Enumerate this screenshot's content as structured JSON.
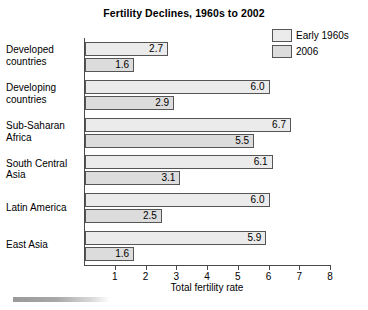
{
  "chart_data": {
    "type": "bar",
    "orientation": "horizontal",
    "title": "Fertility Declines, 1960s to 2002",
    "xlabel": "Total fertility rate",
    "ylabel": "",
    "xlim": [
      0,
      8
    ],
    "xticks": [
      1,
      2,
      3,
      4,
      5,
      6,
      7,
      8
    ],
    "grid": false,
    "legend_position": "top-right",
    "categories": [
      "Developed countries",
      "Developing countries",
      "Sub-Saharan Africa",
      "South Central Asia",
      "Latin America",
      "East Asia"
    ],
    "category_lines": [
      [
        "Developed",
        "countries"
      ],
      [
        "Developing",
        "countries"
      ],
      [
        "Sub-Saharan",
        "Africa"
      ],
      [
        "South Central",
        "Asia"
      ],
      [
        "Latin America",
        ""
      ],
      [
        "East Asia",
        ""
      ]
    ],
    "series": [
      {
        "name": "Early 1960s",
        "color": "#ebebeb",
        "values": [
          2.7,
          6.0,
          6.7,
          6.1,
          6.0,
          5.9
        ],
        "labels": [
          "2.7",
          "6.0",
          "6.7",
          "6.1",
          "6.0",
          "5.9"
        ]
      },
      {
        "name": "2006",
        "color": "#dcdcdc",
        "values": [
          1.6,
          2.9,
          5.5,
          3.1,
          2.5,
          1.6
        ],
        "labels": [
          "1.6",
          "2.9",
          "5.5",
          "3.1",
          "2.5",
          "1.6"
        ]
      }
    ]
  },
  "legend": {
    "items": [
      {
        "label": "Early 1960s",
        "color": "#ebebeb"
      },
      {
        "label": "2006",
        "color": "#dcdcdc"
      }
    ]
  },
  "axis": {
    "tick_labels": [
      "1",
      "2",
      "3",
      "4",
      "5",
      "6",
      "7",
      "8"
    ]
  }
}
